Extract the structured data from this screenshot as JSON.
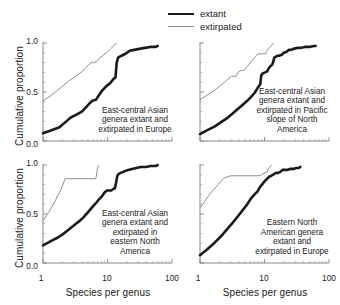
{
  "legend": {
    "entries": [
      {
        "label": "extant",
        "style": "thick-black-line",
        "color": "#1a1a1a"
      },
      {
        "label": "extirpated",
        "style": "thin-gray-line",
        "color": "#8d8d8d"
      }
    ]
  },
  "axes": {
    "ylabel": "Cumulative proportion",
    "xlabel": "Species per genus",
    "yticks": [
      "0.0",
      "0.5",
      "1.0"
    ],
    "xticks": [
      "1",
      "10",
      "100"
    ]
  },
  "chart_data": {
    "type": "line",
    "title": "",
    "xlabel": "Species per genus",
    "ylabel": "Cumulative proportion",
    "xscale": "log",
    "xlim": [
      1,
      100
    ],
    "ylim": [
      0.0,
      1.0
    ],
    "grid": false,
    "legend_position": "top-center",
    "series_names": [
      "extant",
      "extirpated"
    ],
    "panel_layout": "2x2",
    "panels": [
      {
        "caption": "East-central Asian genera extant and extirpated in Europe",
        "series": [
          {
            "name": "extant",
            "color": "#1a1a1a",
            "x": [
              1,
              1.35,
              1.8,
              2.2,
              2.7,
              3.3,
              4.0,
              4.6,
              5.2,
              5.8,
              6.6,
              7.4,
              8.4,
              9.6,
              11.0,
              12.3,
              13.3,
              13.9,
              14.6,
              16.5,
              19.0,
              22.0,
              26.0,
              31.0,
              38.0,
              46.0,
              56.0,
              60.0
            ],
            "y": [
              0.08,
              0.11,
              0.14,
              0.19,
              0.24,
              0.27,
              0.3,
              0.34,
              0.38,
              0.41,
              0.42,
              0.47,
              0.52,
              0.56,
              0.59,
              0.63,
              0.65,
              0.8,
              0.85,
              0.87,
              0.89,
              0.92,
              0.93,
              0.94,
              0.95,
              0.96,
              0.96,
              0.97
            ]
          },
          {
            "name": "extirpated",
            "color": "#8d8d8d",
            "x": [
              1,
              1.3,
              1.7,
              2.1,
              2.6,
              3.2,
              3.9,
              4.5,
              5.1,
              5.7,
              6.3,
              7.0,
              7.6,
              8.4,
              9.2,
              10.0,
              10.8,
              11.6,
              12.4,
              13.2,
              14.0
            ],
            "y": [
              0.41,
              0.46,
              0.52,
              0.57,
              0.62,
              0.66,
              0.7,
              0.74,
              0.78,
              0.8,
              0.8,
              0.82,
              0.85,
              0.87,
              0.89,
              0.91,
              0.93,
              0.95,
              0.97,
              0.99,
              1.0
            ]
          }
        ]
      },
      {
        "caption": "East-central Asian genera extant and extirpated in Pacific slope of North America",
        "series": [
          {
            "name": "extant",
            "color": "#1a1a1a",
            "x": [
              1,
              1.3,
              1.7,
              2.1,
              2.6,
              3.2,
              3.9,
              4.6,
              5.4,
              6.2,
              7.0,
              7.8,
              8.6,
              8.9,
              9.4,
              10.2,
              11.0,
              11.6,
              12.2,
              12.8,
              13.4,
              14.2,
              15.0,
              16.0,
              16.8,
              18.5,
              20.0,
              22.0,
              24.0,
              26.0,
              28.0,
              32.0,
              36.0,
              42.0,
              50.0,
              58.0,
              62.0
            ],
            "y": [
              0.07,
              0.11,
              0.15,
              0.19,
              0.23,
              0.28,
              0.33,
              0.37,
              0.41,
              0.45,
              0.49,
              0.54,
              0.58,
              0.67,
              0.69,
              0.7,
              0.71,
              0.74,
              0.76,
              0.77,
              0.79,
              0.85,
              0.86,
              0.87,
              0.87,
              0.88,
              0.9,
              0.91,
              0.93,
              0.93,
              0.94,
              0.95,
              0.95,
              0.96,
              0.96,
              0.97,
              0.97
            ]
          },
          {
            "name": "extirpated",
            "color": "#8d8d8d",
            "x": [
              1,
              1.3,
              1.7,
              2.1,
              2.6,
              3.1,
              3.6,
              4.0,
              4.4,
              4.8,
              5.4,
              6.0,
              6.6,
              7.2,
              7.6,
              8.2,
              8.8,
              9.6,
              10.4,
              11.0,
              11.8,
              12.6,
              13.4,
              14.0
            ],
            "y": [
              0.42,
              0.47,
              0.52,
              0.57,
              0.62,
              0.66,
              0.66,
              0.71,
              0.72,
              0.72,
              0.76,
              0.8,
              0.83,
              0.86,
              0.88,
              0.89,
              0.89,
              0.89,
              0.89,
              0.92,
              0.95,
              0.97,
              0.99,
              1.0
            ]
          }
        ]
      },
      {
        "caption": "East-central Asian genera extant and extirpated in eastern North America",
        "series": [
          {
            "name": "extant",
            "color": "#1a1a1a",
            "x": [
              1,
              1.3,
              1.7,
              2.1,
              2.6,
              3.1,
              3.7,
              4.3,
              5.0,
              5.8,
              6.6,
              7.4,
              8.2,
              9.0,
              9.8,
              10.6,
              11.4,
              12.0,
              12.6,
              13.0,
              13.6,
              14.2,
              15.0,
              16.0,
              17.5,
              19.0,
              21.0,
              24.0,
              28.0,
              33.0,
              39.0,
              47.0,
              56.0,
              60.0
            ],
            "y": [
              0.18,
              0.22,
              0.26,
              0.3,
              0.35,
              0.39,
              0.43,
              0.47,
              0.52,
              0.57,
              0.61,
              0.65,
              0.68,
              0.72,
              0.74,
              0.74,
              0.74,
              0.75,
              0.76,
              0.76,
              0.82,
              0.89,
              0.91,
              0.92,
              0.93,
              0.94,
              0.95,
              0.96,
              0.97,
              0.98,
              0.98,
              0.99,
              0.99,
              1.0
            ]
          },
          {
            "name": "extirpated",
            "color": "#8d8d8d",
            "x": [
              1,
              1.4,
              1.9,
              2.2,
              3.0,
              4.0,
              5.0,
              6.0,
              6.6,
              6.9,
              7.2
            ],
            "y": [
              0.43,
              0.58,
              0.75,
              0.86,
              0.86,
              0.86,
              0.86,
              0.86,
              0.86,
              0.94,
              1.0
            ]
          }
        ]
      },
      {
        "caption": "Eastern North American genera extant and extirpated in Europe",
        "series": [
          {
            "name": "extant",
            "color": "#1a1a1a",
            "x": [
              1,
              1.3,
              1.7,
              2.1,
              2.6,
              3.2,
              3.9,
              4.6,
              5.4,
              6.2,
              7.0,
              7.8,
              8.6,
              9.4,
              10.2,
              11.0,
              11.8,
              12.6,
              13.4,
              14.2,
              15.2,
              16.4,
              17.6,
              19.0,
              20.5,
              22.5,
              25.0,
              28.0,
              31.0,
              34.0,
              36.0
            ],
            "y": [
              0.08,
              0.14,
              0.21,
              0.27,
              0.34,
              0.41,
              0.48,
              0.54,
              0.6,
              0.66,
              0.7,
              0.73,
              0.78,
              0.81,
              0.84,
              0.86,
              0.88,
              0.89,
              0.9,
              0.91,
              0.92,
              0.92,
              0.93,
              0.95,
              0.95,
              0.95,
              0.96,
              0.96,
              0.97,
              0.97,
              0.98
            ]
          },
          {
            "name": "extirpated",
            "color": "#8d8d8d",
            "x": [
              1,
              1.4,
              1.9,
              2.4,
              3.0,
              3.8,
              4.6,
              5.4,
              6.2,
              7.0,
              8.0,
              9.0,
              10.0,
              10.8,
              11.4,
              11.8,
              12.4,
              13.0
            ],
            "y": [
              0.56,
              0.7,
              0.8,
              0.87,
              0.89,
              0.89,
              0.89,
              0.89,
              0.89,
              0.89,
              0.89,
              0.9,
              0.92,
              0.92,
              0.96,
              0.97,
              0.99,
              1.0
            ]
          }
        ]
      }
    ]
  }
}
